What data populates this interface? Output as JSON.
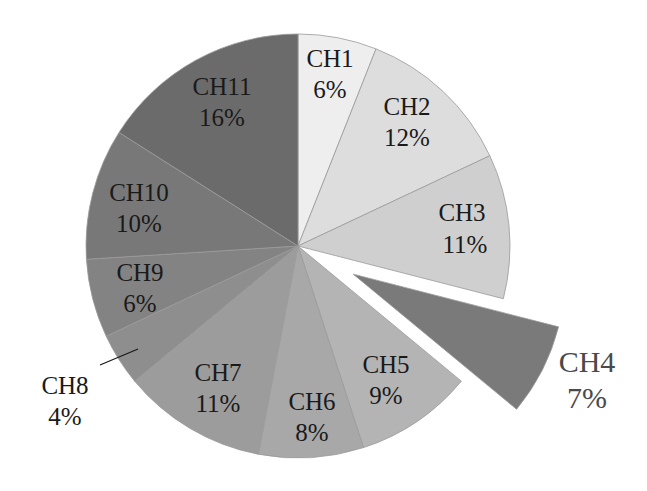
{
  "chart_data": {
    "type": "pie",
    "title": "",
    "categories": [
      "CH1",
      "CH2",
      "CH3",
      "CH4",
      "CH5",
      "CH6",
      "CH7",
      "CH8",
      "CH9",
      "CH10",
      "CH11"
    ],
    "values": [
      6,
      12,
      11,
      7,
      9,
      8,
      11,
      4,
      6,
      10,
      16
    ],
    "labels": [
      "6%",
      "12%",
      "11%",
      "7%",
      "9%",
      "8%",
      "11%",
      "4%",
      "6%",
      "10%",
      "16%"
    ],
    "exploded": [
      "CH4"
    ],
    "start_angle_deg": 90,
    "direction": "clockwise",
    "colors": [
      "#eeeeee",
      "#dddddd",
      "#cfcfcf",
      "#7a7a7a",
      "#b4b4b4",
      "#a8a8a8",
      "#9c9c9c",
      "#8e8e8e",
      "#838383",
      "#787878",
      "#6b6b6b"
    ],
    "legend": "none",
    "label_style": "inside, CH8 and CH4 outside"
  },
  "slices": [
    {
      "name": "CH1",
      "pct": "6%",
      "color": "#eeeeee"
    },
    {
      "name": "CH2",
      "pct": "12%",
      "color": "#dddddd"
    },
    {
      "name": "CH3",
      "pct": "11%",
      "color": "#cfcfcf"
    },
    {
      "name": "CH4",
      "pct": "7%",
      "color": "#7a7a7a"
    },
    {
      "name": "CH5",
      "pct": "9%",
      "color": "#b4b4b4"
    },
    {
      "name": "CH6",
      "pct": "8%",
      "color": "#a8a8a8"
    },
    {
      "name": "CH7",
      "pct": "11%",
      "color": "#9c9c9c"
    },
    {
      "name": "CH8",
      "pct": "4%",
      "color": "#8e8e8e"
    },
    {
      "name": "CH9",
      "pct": "6%",
      "color": "#838383"
    },
    {
      "name": "CH10",
      "pct": "10%",
      "color": "#787878"
    },
    {
      "name": "CH11",
      "pct": "16%",
      "color": "#6b6b6b"
    }
  ]
}
